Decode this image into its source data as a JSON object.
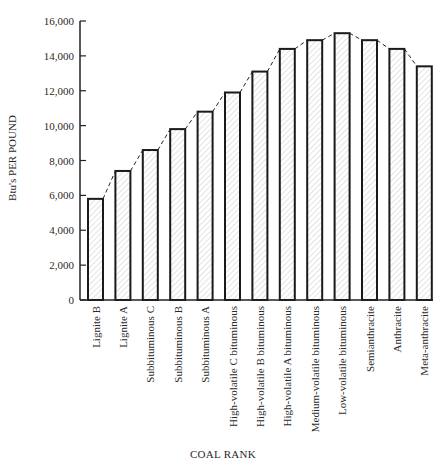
{
  "chart_data": {
    "type": "bar",
    "title": "",
    "xlabel": "COAL RANK",
    "ylabel": "Btu's PER POUND",
    "ylim": [
      0,
      16000
    ],
    "yticks": [
      0,
      2000,
      4000,
      6000,
      8000,
      10000,
      12000,
      14000,
      16000
    ],
    "ytick_labels": [
      "0",
      "2,000",
      "4,000",
      "6,000",
      "8,000",
      "10,000",
      "12,000",
      "14,000",
      "16,000"
    ],
    "grid": false,
    "legend": null,
    "categories": [
      "Lignite B",
      "Lignite A",
      "Subbituminous C",
      "Subbituminous B",
      "Subbituminous A",
      "High-volatile C bituminous",
      "High-volatile B bituminous",
      "High-volatile A bituminous",
      "Medium-volatile bituminous",
      "Low-volatile bituminous",
      "Semianthracite",
      "Anthracite",
      "Meta-anthracite"
    ],
    "values": [
      5800,
      7400,
      8600,
      9800,
      10800,
      11900,
      13100,
      14400,
      14900,
      15300,
      14900,
      14400,
      13400
    ],
    "annotations": [
      "dashed line connecting bar tops"
    ],
    "bar_style": "hatched fill with black outline"
  },
  "labels": {
    "xtitle": "COAL RANK",
    "ytitle": "Btu's PER POUND"
  }
}
